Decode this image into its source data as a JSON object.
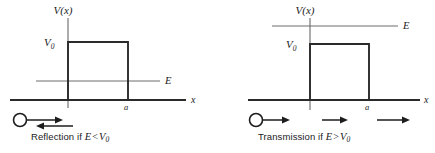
{
  "figure": {
    "type": "physics-diagram",
    "panels": [
      {
        "id": "left",
        "axis_labels": {
          "vertical": "V(x)",
          "horizontal": "x"
        },
        "barrier_height_label": "V",
        "barrier_height_subscript": "0",
        "barrier_width_label": "a",
        "energy_label": "E",
        "energy_relation": "E < V0",
        "energy_above_barrier": false,
        "caption_prefix": "Reflection if ",
        "caption_symbol_energy": "E",
        "caption_operator": "<",
        "caption_symbol_potential": "V",
        "caption_symbol_subscript": "0",
        "caption_full": "Reflection if E < V0",
        "incoming_arrow": true,
        "reflected_arrow": true,
        "transmitted_arrows": 0
      },
      {
        "id": "right",
        "axis_labels": {
          "vertical": "V(x)",
          "horizontal": "x"
        },
        "barrier_height_label": "V",
        "barrier_height_subscript": "0",
        "barrier_width_label": "a",
        "energy_label": "E",
        "energy_relation": "E > V0",
        "energy_above_barrier": true,
        "caption_prefix": "Transmission if ",
        "caption_symbol_energy": "E",
        "caption_operator": ">",
        "caption_symbol_potential": "V",
        "caption_symbol_subscript": "0",
        "caption_full": "Transmission if E > V0",
        "incoming_arrow": true,
        "reflected_arrow": false,
        "transmitted_arrows": 2
      }
    ],
    "colors": {
      "axis": "#2b2b2b",
      "barrier": "#2b2b2b",
      "energy_line": "#6d6d6d",
      "arrow": "#1d1d1d",
      "text": "#1a1a1a",
      "background": "#ffffff"
    }
  }
}
